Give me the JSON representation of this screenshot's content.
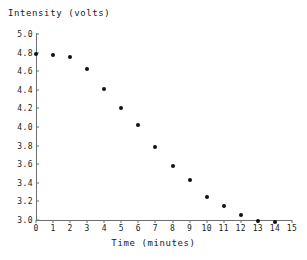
{
  "chart_data": {
    "type": "scatter",
    "title": "",
    "ylabel": "Intensity (volts)",
    "xlabel": "Time (minutes)",
    "xlim": [
      0,
      15
    ],
    "ylim": [
      3.0,
      5.0
    ],
    "grid": false,
    "legend": null,
    "x_ticks": [
      "0",
      "1",
      "2",
      "3",
      "4",
      "5",
      "6",
      "7",
      "8",
      "9",
      "10",
      "11",
      "12",
      "13",
      "14",
      "15"
    ],
    "y_ticks": [
      "5.0",
      "4.8",
      "4.6",
      "4.4",
      "4.2",
      "4.0",
      "3.8",
      "3.6",
      "3.4",
      "3.2",
      "3.0"
    ],
    "x": [
      0,
      1,
      2,
      3,
      4,
      5,
      6,
      7,
      8,
      9,
      10,
      11,
      12,
      13,
      14
    ],
    "values": [
      4.79,
      4.77,
      4.75,
      4.62,
      4.41,
      4.2,
      4.02,
      3.78,
      3.58,
      3.43,
      3.25,
      3.15,
      3.05,
      2.99,
      2.98
    ],
    "marker": "filled-circle",
    "marker_color": "#111111",
    "axis_color": "#6e6e6e"
  }
}
